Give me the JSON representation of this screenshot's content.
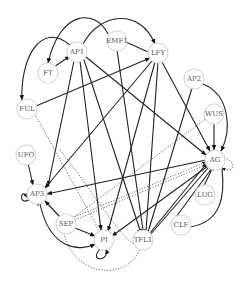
{
  "nodes": [
    {
      "id": "AP1",
      "label": "AP1",
      "x": 77,
      "y": 52
    },
    {
      "id": "EMF1",
      "label": "EMF1",
      "x": 117,
      "y": 41
    },
    {
      "id": "LFY",
      "label": "LFY",
      "x": 158,
      "y": 53
    },
    {
      "id": "FT",
      "label": "FT",
      "x": 48,
      "y": 73
    },
    {
      "id": "FUL",
      "label": "FUL",
      "x": 27,
      "y": 109
    },
    {
      "id": "AP2",
      "label": "AP2",
      "x": 194,
      "y": 79
    },
    {
      "id": "WUS",
      "label": "WUS",
      "x": 214,
      "y": 114
    },
    {
      "id": "AG",
      "label": "AG",
      "x": 215,
      "y": 160
    },
    {
      "id": "LUG",
      "label": "LUG",
      "x": 205,
      "y": 195
    },
    {
      "id": "CLF",
      "label": "CLF",
      "x": 181,
      "y": 225
    },
    {
      "id": "TFL1",
      "label": "TFL1",
      "x": 143,
      "y": 240
    },
    {
      "id": "UFO",
      "label": "UFO",
      "x": 26,
      "y": 155
    },
    {
      "id": "AP3",
      "label": "AP3",
      "x": 37,
      "y": 194
    },
    {
      "id": "SEP",
      "label": "SEP",
      "x": 66,
      "y": 224
    },
    {
      "id": "PI",
      "label": "PI",
      "x": 104,
      "y": 240
    }
  ],
  "legend": {
    "solid": "activation/regulation",
    "dotted": "weak/indirect"
  }
}
